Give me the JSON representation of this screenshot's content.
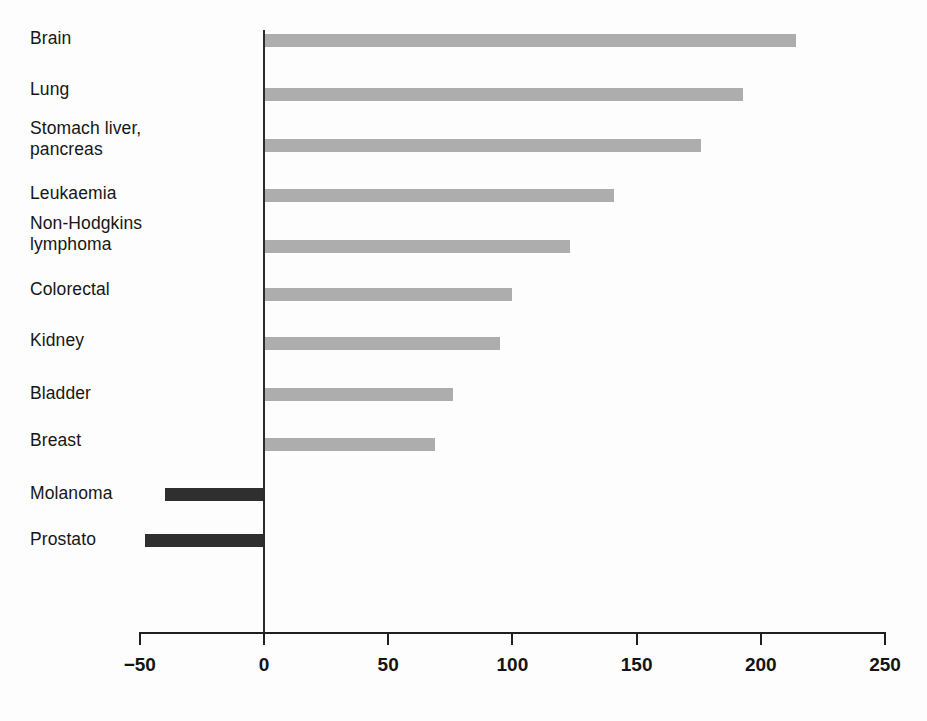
{
  "chart_data": {
    "type": "bar",
    "orientation": "horizontal",
    "title": "",
    "subtitle": "",
    "xlabel": "",
    "ylabel": "",
    "xlim": [
      -50,
      250
    ],
    "xticks": [
      -50,
      0,
      50,
      100,
      150,
      200,
      250
    ],
    "xtick_labels": [
      "−50",
      "0",
      "50",
      "100",
      "150",
      "200",
      "250"
    ],
    "grid": false,
    "legend": "none",
    "zero_line": true,
    "categories": [
      "Brain",
      "Lung",
      "Stomach liver,\npancreas",
      "Leukaemia",
      "Non-Hodgkins\nlymphoma",
      "Colorectal",
      "Kidney",
      "Bladder",
      "Breast",
      "Molanoma",
      "Prostato"
    ],
    "values": [
      214,
      193,
      176,
      141,
      123,
      100,
      95,
      76,
      69,
      -40,
      -48
    ],
    "bar_colors": [
      "#adadad",
      "#adadad",
      "#adadad",
      "#adadad",
      "#adadad",
      "#adadad",
      "#adadad",
      "#adadad",
      "#adadad",
      "#2f2f2f",
      "#2f2f2f"
    ],
    "colors": {
      "positive_bar": "#adadad",
      "negative_bar": "#2f2f2f",
      "axis": "#1f1f1f",
      "text": "#161616",
      "background": "#fdfdfd"
    }
  },
  "labels": {
    "brain": "Brain",
    "lung": "Lung",
    "stomach": "Stomach liver,\npancreas",
    "leukaemia": "Leukaemia",
    "nonhodgkins": "Non-Hodgkins\nlymphoma",
    "colorectal": "Colorectal",
    "kidney": "Kidney",
    "bladder": "Bladder",
    "breast": "Breast",
    "molanoma": "Molanoma",
    "prostato": "Prostato"
  }
}
